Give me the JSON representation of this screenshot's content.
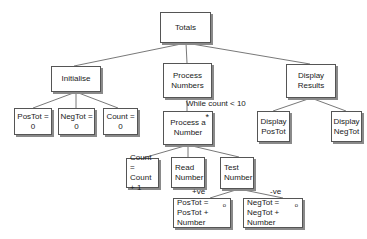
{
  "diagram": {
    "type": "jackson-structure-chart",
    "nodes": {
      "totals": "Totals",
      "initialise": "Initialise",
      "process_numbers": "Process\nNumbers",
      "display_results": "Display\nResults",
      "postot_zero": "PosTot = 0",
      "negtot_zero": "NegTot = 0",
      "count_zero": "Count = 0",
      "process_a_number": "Process a\nNumber",
      "display_postot": "Display\nPosTot",
      "display_negtot": "Display\nNegTot",
      "count_increment": "Count =\nCount + 1",
      "read_number": "Read\nNumber",
      "test_number": "Test\nNumber",
      "postot_add": "PosTot =\nPosTot + Number",
      "negtot_add": "NegTot =\nNegTot + Number"
    },
    "markers": {
      "iteration": "*",
      "selection": "o"
    },
    "edge_labels": {
      "loop_condition": "While count < 10",
      "positive_branch": "+ve",
      "negative_branch": "-ve"
    }
  }
}
